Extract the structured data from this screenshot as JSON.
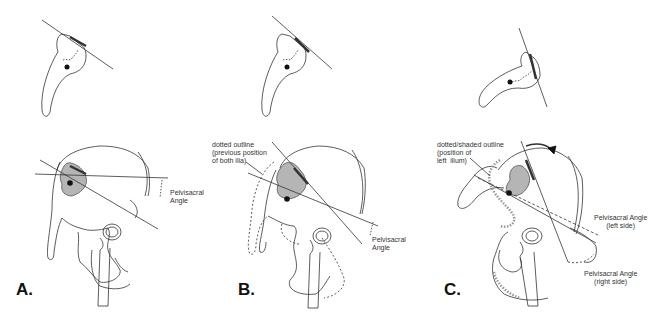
{
  "panels": [
    {
      "id": "A",
      "label": "A.",
      "annotations": [
        {
          "name": "pelvisacral-angle",
          "text": "Pelvisacral\nAngle"
        }
      ]
    },
    {
      "id": "B",
      "label": "B.",
      "annotations": [
        {
          "name": "dotted-outline-note",
          "text": "dotted outline\n(previous position\nof both ilia)"
        },
        {
          "name": "pelvisacral-angle",
          "text": "Pelvisacral\nAngle"
        }
      ]
    },
    {
      "id": "C",
      "label": "C.",
      "annotations": [
        {
          "name": "dotted-shaded-outline-note",
          "text": "dotted/shaded outline\n(position of\nleft  ilium)"
        },
        {
          "name": "pelvisacral-angle-left",
          "text": "Pelvisacral Angle\n(left side)"
        },
        {
          "name": "pelvisacral-angle-right",
          "text": "Pelvisacral Angle\n(right side)"
        }
      ]
    }
  ],
  "colors": {
    "line": "#222222",
    "shade": "#b5b5b5",
    "background": "#ffffff"
  }
}
